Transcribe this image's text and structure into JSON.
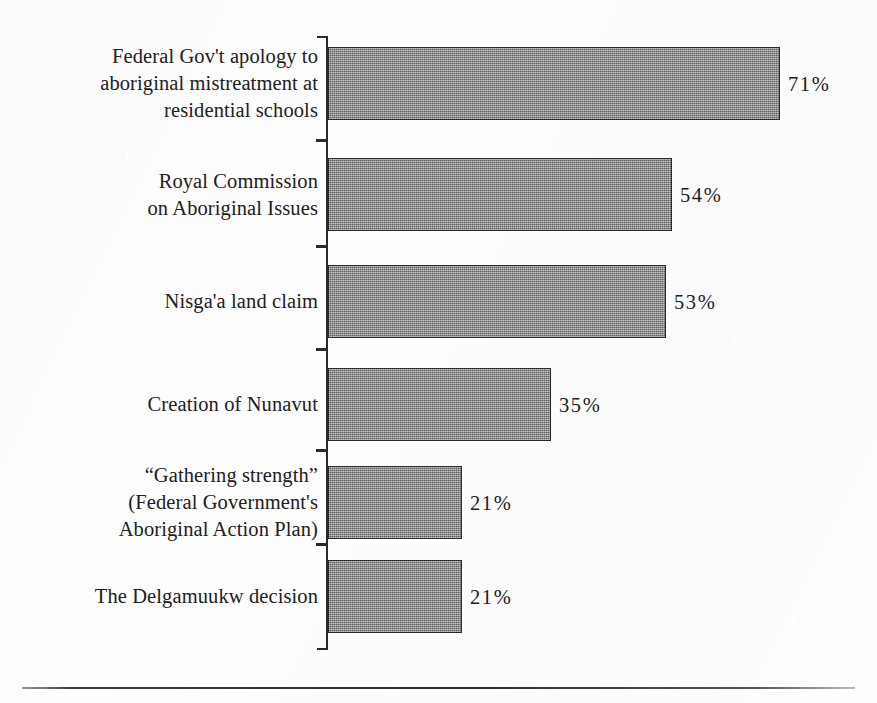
{
  "chart_data": {
    "type": "bar",
    "orientation": "horizontal",
    "title": "",
    "subtitle": "",
    "xlabel": "",
    "ylabel": "",
    "xlim": [
      0,
      100
    ],
    "grid": false,
    "legend": null,
    "value_suffix": "%",
    "categories": [
      "Federal Gov't apology to aboriginal mistreatment at residential schools",
      "Royal Commission on Aboriginal Issues",
      "Nisga'a land claim",
      "Creation of Nunavut",
      "\"Gathering strength\" (Federal Government's Aboriginal Action Plan)",
      "The Delgamuukw decision"
    ],
    "values": [
      71,
      54,
      53,
      35,
      21,
      21
    ],
    "value_labels": [
      "71%",
      "54%",
      "53%",
      "35%",
      "21%",
      "21%"
    ]
  },
  "rows": [
    {
      "label_lines": [
        "Federal Gov't apology to",
        "aboriginal mistreatment at",
        "residential schools"
      ],
      "value": 71,
      "value_label": "71%"
    },
    {
      "label_lines": [
        "Royal Commission",
        "on Aboriginal Issues"
      ],
      "value": 54,
      "value_label": "54%"
    },
    {
      "label_lines": [
        "Nisga'a land claim"
      ],
      "value": 53,
      "value_label": "53%"
    },
    {
      "label_lines": [
        "Creation of Nunavut"
      ],
      "value": 35,
      "value_label": "35%"
    },
    {
      "label_lines": [
        "“Gathering strength”",
        "(Federal Government's",
        "Aboriginal Action Plan)"
      ],
      "value": 21,
      "value_label": "21%"
    },
    {
      "label_lines": [
        "The Delgamuukw decision"
      ],
      "value": 21,
      "value_label": "21%"
    }
  ],
  "style": {
    "bar_fill": "#8b8b8b",
    "bar_stroke": "#2a2a2a",
    "axis_color": "#2b2b2b",
    "text_color": "#202020",
    "page_background": "#fefefe",
    "rule_color": "#2e2e2e"
  },
  "geometry": {
    "axis_x": 327,
    "px_per_percent": 6.37,
    "bar_height": 73,
    "row_tops": [
      47,
      158,
      265,
      368,
      466,
      560
    ],
    "tick_ys": [
      36,
      139,
      245,
      348,
      449,
      543,
      648
    ]
  }
}
